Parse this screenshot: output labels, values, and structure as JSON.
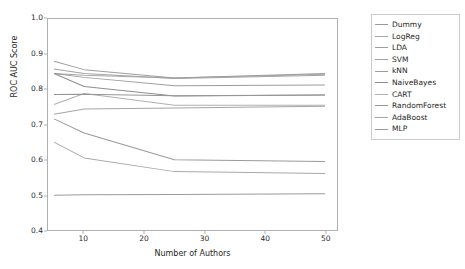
{
  "chart_data": {
    "type": "line",
    "title": "",
    "xlabel": "Number of Authors",
    "ylabel": "ROC AUC Score",
    "xlim": [
      4,
      52
    ],
    "ylim": [
      0.4,
      1.0
    ],
    "xticks": [
      10,
      20,
      30,
      40,
      50
    ],
    "yticks": [
      "0.4",
      "0.5",
      "0.6",
      "0.7",
      "0.8",
      "0.9",
      "1.0"
    ],
    "ytick_values": [
      0.4,
      0.5,
      0.6,
      0.7,
      0.8,
      0.9,
      1.0
    ],
    "grid": false,
    "legend_position": "right-outside",
    "x": [
      5,
      10,
      25,
      50
    ],
    "series": [
      {
        "name": "Dummy",
        "color": "#9a9a9a",
        "values": [
          0.499,
          0.5,
          0.501,
          0.503
        ]
      },
      {
        "name": "LogReg",
        "color": "#a8a8a8",
        "values": [
          0.845,
          0.84,
          0.832,
          0.843
        ]
      },
      {
        "name": "LDA",
        "color": "#9e9e9e",
        "values": [
          0.88,
          0.856,
          0.832,
          0.845
        ]
      },
      {
        "name": "SVM",
        "color": "#a3a3a3",
        "values": [
          0.858,
          0.845,
          0.831,
          0.84
        ]
      },
      {
        "name": "kNN",
        "color": "#9c9c9c",
        "values": [
          0.845,
          0.834,
          0.81,
          0.812
        ]
      },
      {
        "name": "NaiveBayes",
        "color": "#8f8f8f",
        "values": [
          0.845,
          0.808,
          0.781,
          0.784
        ]
      },
      {
        "name": "CART",
        "color": "#b0b0b0",
        "values": [
          0.757,
          0.788,
          0.755,
          0.755
        ]
      },
      {
        "name": "RandomForest",
        "color": "#969696",
        "values": [
          0.785,
          0.786,
          0.782,
          0.784
        ]
      },
      {
        "name": "AdaBoost",
        "color": "#a5a5a5",
        "values": [
          0.729,
          0.744,
          0.747,
          0.752
        ]
      },
      {
        "name": "MLP",
        "color": "#9a9a9a",
        "values": [
          0.716,
          0.676,
          0.6,
          0.595
        ]
      }
    ],
    "extra_series": [
      {
        "name": "lower-trend",
        "color": "#a8a8a8",
        "values": [
          0.65,
          0.605,
          0.566,
          0.561
        ]
      }
    ]
  },
  "legend": {
    "items": [
      {
        "label": "Dummy"
      },
      {
        "label": "LogReg"
      },
      {
        "label": "LDA"
      },
      {
        "label": "SVM"
      },
      {
        "label": "kNN"
      },
      {
        "label": "NaiveBayes"
      },
      {
        "label": "CART"
      },
      {
        "label": "RandomForest"
      },
      {
        "label": "AdaBoost"
      },
      {
        "label": "MLP"
      }
    ]
  },
  "colors": {
    "axis": "#b0b0b0",
    "text": "#1f1f1f",
    "background": "#ffffff",
    "legend_border": "#cccccc"
  }
}
